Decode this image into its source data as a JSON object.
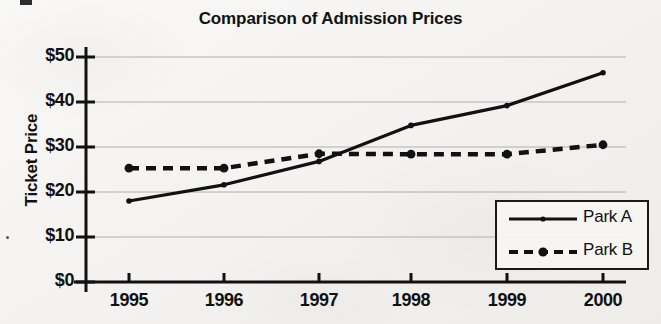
{
  "chart_data": {
    "type": "line",
    "title": "Comparison of Admission Prices",
    "xlabel": "",
    "ylabel": "Ticket Price",
    "x": [
      "1995",
      "1996",
      "1997",
      "1998",
      "1999",
      "2000"
    ],
    "categories": [
      "1995",
      "1996",
      "1997",
      "1998",
      "1999",
      "2000"
    ],
    "xtick_labels": [
      "1995",
      "1996",
      "1997",
      "1998",
      "1999",
      "2000"
    ],
    "ytick_labels": [
      "$0",
      "$10",
      "$20",
      "$30",
      "$40",
      "$50"
    ],
    "ytick_values": [
      0,
      10,
      20,
      30,
      40,
      50
    ],
    "ylim": [
      0,
      50
    ],
    "grid": "horizontal",
    "legend_position": "lower right",
    "series": [
      {
        "name": "Park A",
        "style": "solid",
        "marker": "small-dot",
        "color": "#111111",
        "values": [
          18.0,
          21.6,
          26.8,
          34.8,
          39.2,
          46.5
        ]
      },
      {
        "name": "Park B",
        "style": "dashed",
        "marker": "large-dot",
        "color": "#111111",
        "values": [
          25.3,
          25.3,
          28.5,
          28.4,
          28.4,
          30.5
        ]
      }
    ]
  },
  "legend": {
    "entries": [
      {
        "label": "Park A"
      },
      {
        "label": "Park B"
      }
    ]
  },
  "axes": {
    "y_axis_title": "Ticket Price"
  },
  "colors": {
    "background": "#f2f1ee",
    "ink": "#111111",
    "gridline": "#9a9a9a"
  }
}
